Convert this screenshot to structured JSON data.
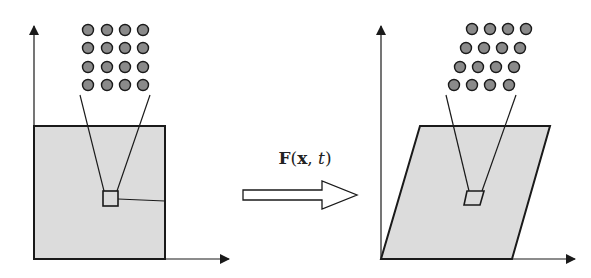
{
  "diagram": {
    "mapping_label": {
      "func": "F",
      "open": "(",
      "arg1": "x",
      "sep": ", ",
      "arg2": "t",
      "close": ")"
    },
    "colors": {
      "region_fill": "#dcdcdc",
      "stroke": "#1a1a1a",
      "dot_fill": "#8a8a8a",
      "arrow_fill": "#ffffff"
    },
    "left_panel": {
      "description": "Reference configuration: square region with lattice of particles",
      "lattice": "4x4 square grid"
    },
    "right_panel": {
      "description": "Deformed configuration: sheared parallelogram region with sheared lattice",
      "lattice": "4x4 sheared grid"
    }
  }
}
